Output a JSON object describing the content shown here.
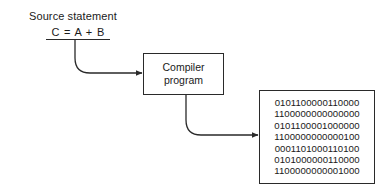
{
  "diagram": {
    "source_label": "Source statement",
    "source_statement": "C = A + B",
    "compiler_box": {
      "lines": [
        "Compiler",
        "program"
      ]
    },
    "machine_code_box": {
      "lines": [
        "0101100000110000",
        "1100000000000000",
        "0101100001000000",
        "1100000000000100",
        "0001101000110100",
        "0101000000110000",
        "1100000000001000"
      ]
    },
    "arrows": [
      {
        "from": "source-statement",
        "to": "compiler-box"
      },
      {
        "from": "compiler-box",
        "to": "machine-code-box"
      }
    ],
    "colors": {
      "line": "#2a2a2a",
      "text": "#1a1a1a",
      "background": "#ffffff"
    }
  }
}
